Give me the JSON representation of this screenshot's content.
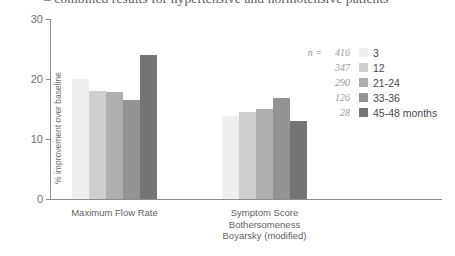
{
  "chart_data": {
    "type": "bar",
    "title": "– combined results for hypertensive and normotensive patients",
    "xlabel": "",
    "ylabel": "% improvement over baseline",
    "ylim": [
      0,
      30
    ],
    "yticks": [
      0,
      10,
      20,
      30
    ],
    "ytick_labels": [
      "0",
      "10",
      "20",
      "30"
    ],
    "grid": false,
    "legend_position": "right",
    "categories": [
      "Maximum Flow Rate",
      "Symptom Score\nBothersomeness\nBoyarsky (modified)"
    ],
    "category_lines": [
      [
        "Maximum Flow Rate"
      ],
      [
        "Symptom Score",
        "Bothersomeness",
        "Boyarsky (modified)"
      ]
    ],
    "series": [
      {
        "name": "3",
        "n": "416",
        "color": "#efefef",
        "values": [
          20.0,
          13.8
        ]
      },
      {
        "name": "12",
        "n": "347",
        "color": "#cfcfcf",
        "values": [
          18.0,
          14.5
        ]
      },
      {
        "name": "21-24",
        "n": "290",
        "color": "#aeaeae",
        "values": [
          17.8,
          15.0
        ]
      },
      {
        "name": "33-36",
        "n": "126",
        "color": "#949494",
        "values": [
          16.5,
          16.8
        ]
      },
      {
        "name": "45-48 months",
        "n": "28",
        "color": "#747474",
        "values": [
          24.0,
          13.0
        ]
      }
    ],
    "legend_n_prefix": "n ="
  },
  "colors": {
    "axis": "#8d8d8d",
    "tick_text": "#6f6f6f",
    "label_text": "#5f5f5f",
    "legend_n_text": "#9a9a9a",
    "background": "#ffffff"
  }
}
